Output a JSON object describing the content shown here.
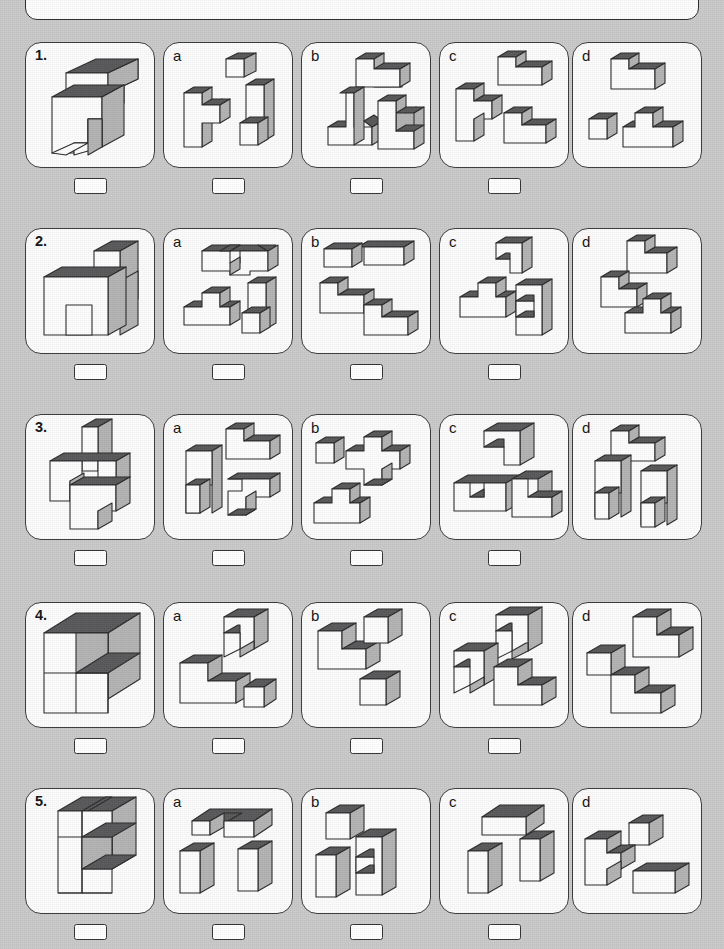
{
  "page": {
    "kind": "spatial-reasoning-worksheet",
    "background_color": "#c9c9c9",
    "top_panel": {
      "text": ""
    },
    "columns": 5,
    "rows": 5
  },
  "palette": {
    "top_face": "#58585a",
    "front_face": "#fdfdfd",
    "side_face": "#b3b3b3",
    "outline": "#2b2b2b",
    "cell_fill": "#fcfcfc",
    "cell_border": "#3a3a3a",
    "answer_box_fill": "#ffffff"
  },
  "rows": [
    {
      "number": "1.",
      "stem": {
        "name": "stem-figure-1",
        "block_count": 8
      },
      "options": [
        {
          "label": "a",
          "pieces": 3,
          "answer_value": ""
        },
        {
          "label": "b",
          "pieces": 3,
          "answer_value": ""
        },
        {
          "label": "c",
          "pieces": 3,
          "answer_value": ""
        },
        {
          "label": "d",
          "pieces": 3,
          "answer_value": ""
        }
      ]
    },
    {
      "number": "2.",
      "stem": {
        "name": "stem-figure-2",
        "block_count": 9
      },
      "options": [
        {
          "label": "a",
          "pieces": 3,
          "answer_value": ""
        },
        {
          "label": "b",
          "pieces": 3,
          "answer_value": ""
        },
        {
          "label": "c",
          "pieces": 3,
          "answer_value": ""
        },
        {
          "label": "d",
          "pieces": 3,
          "answer_value": ""
        }
      ]
    },
    {
      "number": "3.",
      "stem": {
        "name": "stem-figure-3",
        "block_count": 9
      },
      "options": [
        {
          "label": "a",
          "pieces": 3,
          "answer_value": ""
        },
        {
          "label": "b",
          "pieces": 3,
          "answer_value": ""
        },
        {
          "label": "c",
          "pieces": 3,
          "answer_value": ""
        },
        {
          "label": "d",
          "pieces": 3,
          "answer_value": ""
        }
      ]
    },
    {
      "number": "4.",
      "stem": {
        "name": "stem-figure-4",
        "block_count": 7
      },
      "options": [
        {
          "label": "a",
          "pieces": 3,
          "answer_value": ""
        },
        {
          "label": "b",
          "pieces": 3,
          "answer_value": ""
        },
        {
          "label": "c",
          "pieces": 3,
          "answer_value": ""
        },
        {
          "label": "d",
          "pieces": 3,
          "answer_value": ""
        }
      ]
    },
    {
      "number": "5.",
      "stem": {
        "name": "stem-figure-5",
        "block_count": 8
      },
      "options": [
        {
          "label": "a",
          "pieces": 3,
          "answer_value": ""
        },
        {
          "label": "b",
          "pieces": 3,
          "answer_value": ""
        },
        {
          "label": "c",
          "pieces": 3,
          "answer_value": ""
        },
        {
          "label": "d",
          "pieces": 3,
          "answer_value": ""
        }
      ]
    }
  ]
}
